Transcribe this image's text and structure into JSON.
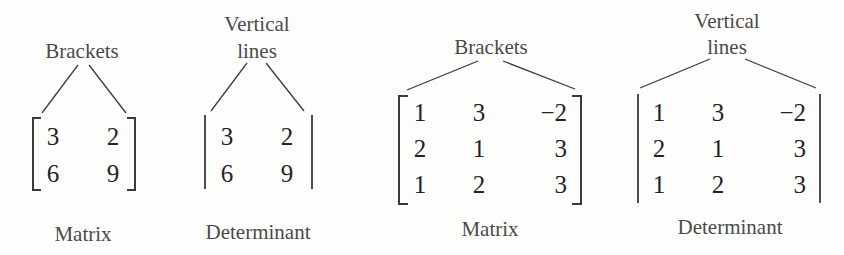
{
  "panels": [
    {
      "id": "matrix-2x2",
      "top_label_lines": [
        "Brackets"
      ],
      "bottom_label": "Matrix",
      "delimiter": "brackets",
      "rows": [
        [
          "3",
          "2"
        ],
        [
          "6",
          "9"
        ]
      ]
    },
    {
      "id": "determinant-2x2",
      "top_label_lines": [
        "Vertical",
        "lines"
      ],
      "bottom_label": "Determinant",
      "delimiter": "vertical-lines",
      "rows": [
        [
          "3",
          "2"
        ],
        [
          "6",
          "9"
        ]
      ]
    },
    {
      "id": "matrix-3x3",
      "top_label_lines": [
        "Brackets"
      ],
      "bottom_label": "Matrix",
      "delimiter": "brackets",
      "rows": [
        [
          "1",
          "3",
          "−2"
        ],
        [
          "2",
          "1",
          "3"
        ],
        [
          "1",
          "2",
          "3"
        ]
      ]
    },
    {
      "id": "determinant-3x3",
      "top_label_lines": [
        "Vertical",
        "lines"
      ],
      "bottom_label": "Determinant",
      "delimiter": "vertical-lines",
      "rows": [
        [
          "1",
          "3",
          "−2"
        ],
        [
          "2",
          "1",
          "3"
        ],
        [
          "1",
          "2",
          "3"
        ]
      ]
    }
  ],
  "colors": {
    "background": "#fdfdfc",
    "ink": "#222222",
    "label": "#4a4a4a"
  }
}
